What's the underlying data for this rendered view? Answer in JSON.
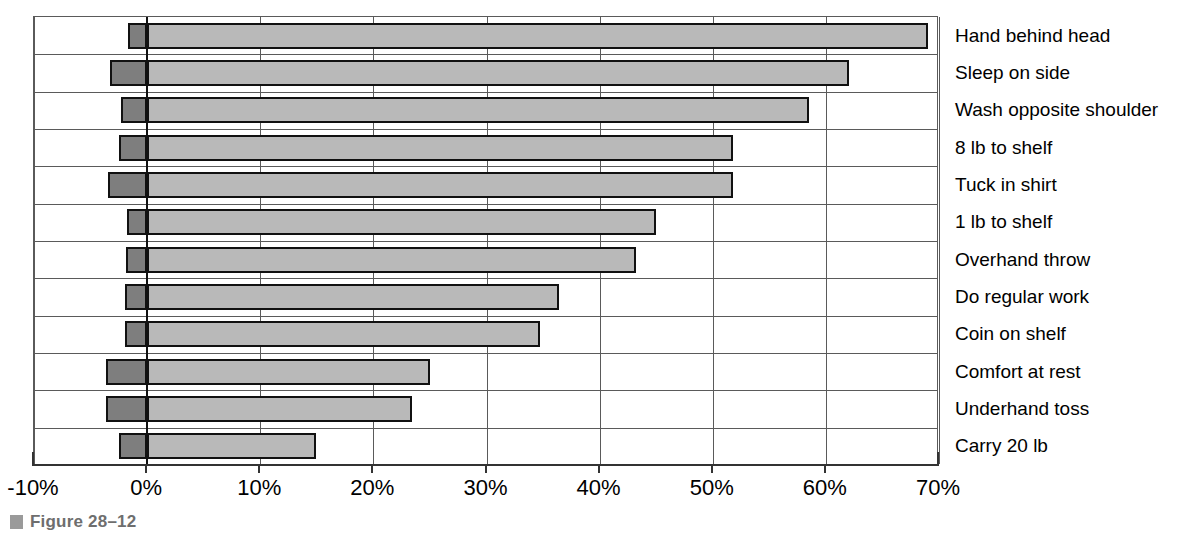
{
  "figure": {
    "caption_label": "Figure 28–12",
    "marker_name": "figure-bullet-marker"
  },
  "chart_data": {
    "type": "bar",
    "orientation": "horizontal",
    "title": "",
    "subtitle": "",
    "xlabel": "",
    "ylabel": "",
    "xlim": [
      -10,
      70
    ],
    "xtick_step": 10,
    "grid": true,
    "grid_axis": "x",
    "legend": "none",
    "legend_position": "none",
    "categories": [
      "Hand behind head",
      "Sleep on side",
      "Wash opposite shoulder",
      "8 lb to shelf",
      "Tuck in shirt",
      "1 lb to shelf",
      "Overhand throw",
      "Do regular work",
      "Coin on shelf",
      "Comfort at rest",
      "Underhand toss",
      "Carry 20 lb"
    ],
    "tick_labels": [
      "-10%",
      "0%",
      "10%",
      "20%",
      "30%",
      "40%",
      "50%",
      "60%",
      "70%"
    ],
    "tick_values": [
      -10,
      0,
      10,
      20,
      30,
      40,
      50,
      60,
      70
    ],
    "series": [
      {
        "name": "negative",
        "color": "#7e7e7e",
        "values": [
          -1.7,
          -3.3,
          -2.3,
          -2.5,
          -3.5,
          -1.8,
          -1.9,
          -2.0,
          -2.0,
          -3.6,
          -3.6,
          -2.5
        ]
      },
      {
        "name": "positive",
        "color": "#b9b9b9",
        "values": [
          69.0,
          62.0,
          58.5,
          51.8,
          51.8,
          45.0,
          43.2,
          36.4,
          34.7,
          25.0,
          23.4,
          14.9
        ]
      }
    ]
  },
  "colors": {
    "positive_fill": "#b9b9b9",
    "negative_fill": "#7e7e7e",
    "bar_outline": "#111111",
    "grid": "#5a5a5a",
    "axis": "#333333",
    "caption": "#6e6e6e"
  }
}
